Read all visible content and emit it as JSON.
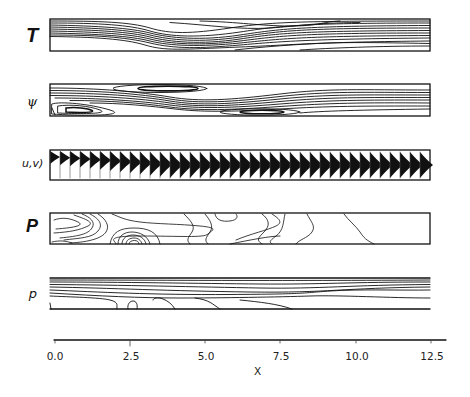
{
  "figure": {
    "panels": [
      {
        "id": "T",
        "label": "T",
        "description": "temperature contours"
      },
      {
        "id": "psi",
        "label": "ψ",
        "description": "streamfunction contours"
      },
      {
        "id": "uv",
        "label": "u,v)",
        "description": "velocity profile vectors"
      },
      {
        "id": "P",
        "label": "P",
        "description": "pressure contours"
      },
      {
        "id": "p",
        "label": "p",
        "description": "density contours"
      }
    ],
    "x_axis": {
      "label": "X",
      "ticks": [
        "0.0",
        "2.5",
        "5.0",
        "7.5",
        "10.0",
        "12.5"
      ]
    }
  },
  "chart_data": {
    "type": "contour",
    "title": "",
    "xlabel": "X",
    "ylabel": "",
    "xlim": [
      0.0,
      12.5
    ],
    "x_ticks": [
      0.0,
      2.5,
      5.0,
      7.5,
      10.0,
      12.5
    ],
    "panels": [
      "T",
      "ψ",
      "(u,v)",
      "P",
      "p"
    ],
    "grid": false,
    "legend": null
  }
}
